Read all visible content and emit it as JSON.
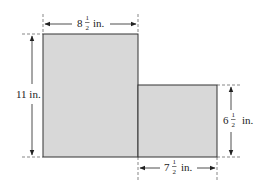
{
  "diagram": {
    "shape": "L-shaped composite figure of two rectangles",
    "fill_color": "#d8d8d8",
    "stroke_color": "#333333",
    "dimensions": {
      "top_width": {
        "whole": "8",
        "num": "1",
        "den": "2",
        "unit": "in."
      },
      "left_height": {
        "text": "11 in."
      },
      "right_height": {
        "whole": "6",
        "num": "1",
        "den": "2",
        "unit": "in."
      },
      "bottom_width": {
        "whole": "7",
        "num": "1",
        "den": "2",
        "unit": "in."
      }
    }
  }
}
